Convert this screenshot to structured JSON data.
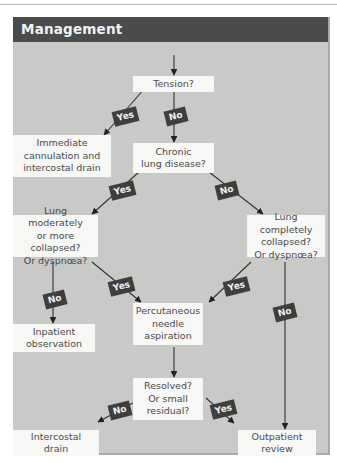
{
  "panel": {
    "title": "Management"
  },
  "nodes": {
    "tension": "Tension?",
    "immediate": "Immediate\ncannulation and\nintercostal drain",
    "chronic": "Chronic\nlung disease?",
    "moderate": "Lung moderately\nor more collapsed?\nOr dyspnœa?",
    "complete": "Lung completely\ncollapsed?\nOr dyspnœa?",
    "inpatient": "Inpatient\nobservation",
    "aspiration": "Percutaneous\nneedle\naspiration",
    "resolved": "Resolved?\nOr small\nresidual?",
    "drain": "Intercostal\ndrain",
    "outpatient": "Outpatient\nreview"
  },
  "badges": {
    "tension_yes": "Yes",
    "tension_no": "No",
    "chronic_yes": "Yes",
    "chronic_no": "No",
    "moderate_no": "No",
    "moderate_yes": "Yes",
    "complete_yes": "Yes",
    "complete_no": "No",
    "resolved_no": "No",
    "resolved_yes": "Yes"
  },
  "colors": {
    "header_bg": "#4b4b4b",
    "panel_bg": "#c9c9c7",
    "node_bg": "#f7f7f5",
    "badge_bg": "#3e3e3e",
    "arrow": "#222222"
  }
}
